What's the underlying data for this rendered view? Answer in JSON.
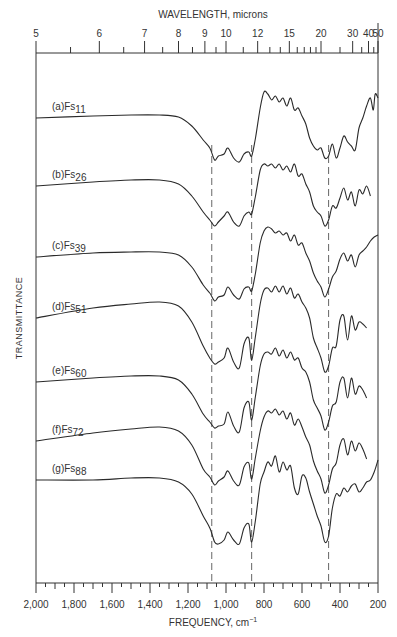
{
  "chart_data": {
    "type": "line",
    "title": "",
    "top_axis": {
      "label": "WAVELENGTH, microns",
      "tick_labels": [
        "5",
        "6",
        "7",
        "8",
        "9",
        "10",
        "12",
        "15",
        "20",
        "30",
        "40",
        "50"
      ],
      "tick_values_um": [
        5,
        6,
        7,
        8,
        9,
        10,
        12,
        15,
        20,
        30,
        40,
        50
      ],
      "minor_ticks_um": [
        5.5,
        6.5,
        7.5,
        8.5,
        9.5,
        11,
        13,
        14,
        16,
        17,
        18,
        19,
        25,
        35,
        45
      ]
    },
    "xlabel": "FREQUENCY, cm",
    "xlabel_sup": "−1",
    "ylabel": "TRANSMITTANCE",
    "xlim": [
      2000,
      200
    ],
    "x_tick_labels": [
      "2,000",
      "1,800",
      "1,600",
      "1,400",
      "1,200",
      "1,000",
      "800",
      "600",
      "400",
      "200"
    ],
    "x_tick_values": [
      2000,
      1800,
      1600,
      1400,
      1200,
      1000,
      800,
      600,
      400,
      200
    ],
    "grid": false,
    "reference_lines_cm1": [
      1075,
      865,
      460
    ],
    "series": [
      {
        "name": "(a)Fs11",
        "prefix": "(a)Fs",
        "sub": "11",
        "offset_y": 118,
        "x": [
          2000,
          1700,
          1500,
          1350,
          1250,
          1180,
          1120,
          1085,
          1060,
          1040,
          1010,
          990,
          960,
          930,
          905,
          880,
          865,
          845,
          820,
          800,
          780,
          760,
          740,
          720,
          700,
          680,
          660,
          640,
          620,
          600,
          580,
          560,
          540,
          520,
          500,
          480,
          460,
          440,
          420,
          400,
          380,
          360,
          340,
          320,
          300,
          280,
          260,
          240,
          225,
          215,
          200
        ],
        "y": [
          0,
          -2,
          -3,
          -3,
          -1,
          8,
          22,
          30,
          42,
          38,
          36,
          30,
          40,
          44,
          36,
          34,
          38,
          20,
          -10,
          -26,
          -24,
          -18,
          -22,
          -16,
          -20,
          -12,
          -20,
          -8,
          -10,
          -2,
          6,
          20,
          28,
          32,
          30,
          40,
          38,
          26,
          40,
          30,
          18,
          24,
          28,
          32,
          10,
          0,
          -12,
          -20,
          -8,
          -24,
          -20
        ]
      },
      {
        "name": "(b)Fs26",
        "prefix": "(b)Fs",
        "sub": "26",
        "offset_y": 186,
        "x": [
          2000,
          1700,
          1500,
          1350,
          1250,
          1180,
          1120,
          1085,
          1060,
          1040,
          1010,
          990,
          960,
          930,
          905,
          880,
          865,
          845,
          820,
          800,
          780,
          760,
          740,
          720,
          700,
          680,
          660,
          640,
          620,
          600,
          580,
          560,
          540,
          520,
          500,
          480,
          460,
          440,
          420,
          400,
          380,
          360,
          340,
          320,
          300,
          280,
          260,
          240
        ],
        "y": [
          0,
          -4,
          -6,
          -6,
          -2,
          10,
          26,
          34,
          40,
          36,
          30,
          26,
          36,
          40,
          30,
          26,
          28,
          10,
          -16,
          -22,
          -20,
          -22,
          -18,
          -22,
          -16,
          -20,
          -14,
          -22,
          -10,
          -12,
          -2,
          6,
          20,
          26,
          30,
          40,
          34,
          20,
          22,
          12,
          2,
          14,
          6,
          20,
          4,
          8,
          0,
          10
        ]
      },
      {
        "name": "(c)Fs39",
        "prefix": "(c)Fs",
        "sub": "39",
        "offset_y": 257,
        "x": [
          2000,
          1700,
          1500,
          1350,
          1250,
          1180,
          1120,
          1085,
          1060,
          1040,
          1010,
          990,
          960,
          930,
          905,
          880,
          865,
          845,
          820,
          800,
          780,
          760,
          740,
          720,
          700,
          680,
          660,
          640,
          620,
          600,
          580,
          560,
          540,
          520,
          500,
          480,
          460,
          440,
          420,
          400,
          380,
          360,
          340,
          320,
          300,
          280,
          260,
          240,
          220,
          200
        ],
        "y": [
          0,
          -4,
          -5,
          -5,
          -2,
          10,
          28,
          36,
          44,
          40,
          38,
          30,
          38,
          42,
          32,
          30,
          34,
          16,
          -14,
          -26,
          -30,
          -28,
          -24,
          -26,
          -22,
          -24,
          -16,
          -22,
          -12,
          -14,
          -4,
          4,
          16,
          24,
          30,
          40,
          32,
          20,
          14,
          2,
          -4,
          4,
          -2,
          10,
          -2,
          -6,
          -10,
          -16,
          -20,
          -22
        ]
      },
      {
        "name": "(d)Fs51",
        "prefix": "(d)Fs",
        "sub": "51",
        "offset_y": 318,
        "x": [
          2000,
          1700,
          1500,
          1350,
          1250,
          1180,
          1120,
          1085,
          1060,
          1040,
          1010,
          990,
          960,
          930,
          905,
          880,
          865,
          845,
          820,
          800,
          780,
          760,
          740,
          720,
          700,
          680,
          660,
          640,
          620,
          600,
          580,
          560,
          540,
          520,
          500,
          480,
          460,
          440,
          420,
          400,
          380,
          360,
          340,
          320,
          300,
          280,
          260
        ],
        "y": [
          0,
          -10,
          -14,
          -16,
          -12,
          4,
          28,
          40,
          46,
          44,
          40,
          30,
          44,
          50,
          26,
          20,
          42,
          18,
          -14,
          -28,
          -30,
          -26,
          -32,
          -26,
          -32,
          -24,
          -30,
          -20,
          -24,
          -16,
          -10,
          0,
          20,
          30,
          40,
          54,
          48,
          30,
          28,
          2,
          -2,
          22,
          -2,
          12,
          4,
          6,
          10
        ]
      },
      {
        "name": "(e)Fs60",
        "prefix": "(e)Fs",
        "sub": "60",
        "offset_y": 382,
        "x": [
          2000,
          1700,
          1500,
          1350,
          1250,
          1180,
          1120,
          1085,
          1060,
          1040,
          1010,
          990,
          960,
          930,
          905,
          880,
          865,
          845,
          820,
          800,
          780,
          760,
          740,
          720,
          700,
          680,
          660,
          640,
          620,
          600,
          580,
          560,
          540,
          520,
          500,
          480,
          460,
          440,
          420,
          400,
          380,
          360,
          340,
          320,
          300,
          280,
          260
        ],
        "y": [
          0,
          -4,
          -6,
          -6,
          -2,
          12,
          32,
          40,
          46,
          44,
          42,
          30,
          44,
          50,
          26,
          20,
          38,
          14,
          -16,
          -28,
          -30,
          -28,
          -34,
          -26,
          -32,
          -24,
          -30,
          -22,
          -24,
          -14,
          -10,
          0,
          18,
          26,
          34,
          48,
          40,
          24,
          20,
          0,
          -4,
          16,
          -4,
          12,
          4,
          8,
          16
        ]
      },
      {
        "name": "(f)Fs72",
        "prefix": "(f)Fs",
        "sub": "72",
        "offset_y": 441,
        "x": [
          2000,
          1700,
          1500,
          1350,
          1250,
          1180,
          1120,
          1085,
          1060,
          1040,
          1010,
          990,
          960,
          930,
          905,
          880,
          865,
          845,
          820,
          800,
          780,
          760,
          740,
          720,
          700,
          680,
          660,
          640,
          620,
          600,
          580,
          560,
          540,
          520,
          500,
          480,
          460,
          440,
          420,
          400,
          380,
          360,
          340,
          320,
          300,
          280,
          260
        ],
        "y": [
          0,
          -8,
          -12,
          -14,
          -10,
          4,
          28,
          36,
          44,
          40,
          36,
          30,
          40,
          44,
          26,
          22,
          38,
          16,
          -10,
          -24,
          -30,
          -28,
          -32,
          -26,
          -30,
          -22,
          -28,
          -16,
          -22,
          -14,
          -4,
          4,
          20,
          30,
          38,
          52,
          44,
          28,
          22,
          4,
          -2,
          14,
          0,
          10,
          2,
          8,
          18
        ]
      },
      {
        "name": "(g)Fs88",
        "prefix": "(g)Fs",
        "sub": "88",
        "offset_y": 480,
        "x": [
          2000,
          1700,
          1500,
          1350,
          1250,
          1180,
          1120,
          1085,
          1060,
          1040,
          1010,
          990,
          960,
          930,
          905,
          880,
          865,
          845,
          820,
          800,
          780,
          760,
          740,
          720,
          700,
          680,
          660,
          640,
          620,
          600,
          580,
          560,
          540,
          520,
          500,
          480,
          460,
          440,
          420,
          400,
          380,
          360,
          340,
          320,
          300,
          280,
          260,
          240,
          220,
          200
        ],
        "y": [
          0,
          0,
          -2,
          -2,
          2,
          14,
          36,
          48,
          62,
          64,
          60,
          52,
          60,
          64,
          48,
          44,
          62,
          40,
          4,
          -8,
          -18,
          -14,
          -24,
          -8,
          -18,
          -10,
          -14,
          8,
          14,
          -4,
          -2,
          12,
          24,
          36,
          46,
          62,
          56,
          28,
          14,
          16,
          8,
          12,
          6,
          4,
          12,
          8,
          2,
          0,
          -8,
          -20
        ]
      }
    ]
  }
}
